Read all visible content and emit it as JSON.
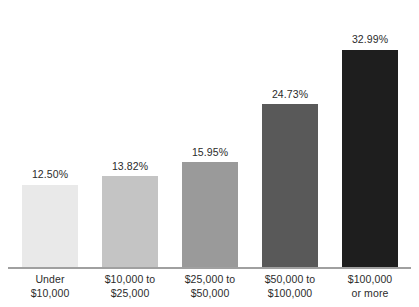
{
  "chart_data": {
    "type": "bar",
    "title": "",
    "subtitle": "",
    "xlabel": "",
    "ylabel": "",
    "ylim": [
      0,
      36
    ],
    "grid": false,
    "legend": "none",
    "orientation": "vertical",
    "categories": [
      "Under $10,000",
      "$10,000 to $25,000",
      "$25,000 to $50,000",
      "$50,000 to $100,000",
      "$100,000 or more"
    ],
    "category_lines": [
      [
        "Under",
        "$10,000"
      ],
      [
        "$10,000 to",
        "$25,000"
      ],
      [
        "$25,000 to",
        "$50,000"
      ],
      [
        "$50,000 to",
        "$100,000"
      ],
      [
        "$100,000",
        "or more"
      ]
    ],
    "values": [
      12.5,
      13.82,
      15.95,
      24.73,
      32.99
    ],
    "value_labels": [
      "12.50%",
      "13.82%",
      "15.95%",
      "24.73%",
      "32.99%"
    ],
    "bar_colors": [
      "#e9e9e9",
      "#c4c4c4",
      "#9a9a9a",
      "#595959",
      "#1e1e1e"
    ]
  },
  "bars": [
    {
      "label": "12.50%",
      "value": 12.5,
      "color": "#e9e9e9",
      "cat_line1": "Under",
      "cat_line2": "$10,000"
    },
    {
      "label": "13.82%",
      "value": 13.82,
      "color": "#c4c4c4",
      "cat_line1": "$10,000 to",
      "cat_line2": "$25,000"
    },
    {
      "label": "15.95%",
      "value": 15.95,
      "color": "#9a9a9a",
      "cat_line1": "$25,000 to",
      "cat_line2": "$50,000"
    },
    {
      "label": "24.73%",
      "value": 24.73,
      "color": "#595959",
      "cat_line1": "$50,000 to",
      "cat_line2": "$100,000"
    },
    {
      "label": "32.99%",
      "value": 32.99,
      "color": "#1e1e1e",
      "cat_line1": "$100,000",
      "cat_line2": "or more"
    }
  ],
  "style": {
    "background": "#ffffff",
    "axis_color": "#a0a0a0",
    "text_color": "#2b2b2b"
  }
}
